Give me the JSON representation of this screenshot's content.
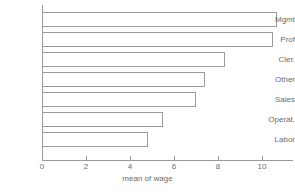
{
  "chart_data": {
    "type": "bar",
    "orientation": "horizontal",
    "title": "",
    "subtitle": "",
    "xlabel": "mean of wage",
    "ylabel": "",
    "categories": [
      "Mgmt",
      "Prof",
      "Cler.",
      "Other",
      "Sales",
      "Operat.",
      "Labor"
    ],
    "values": [
      10.7,
      10.5,
      8.3,
      7.4,
      7.0,
      5.5,
      4.8
    ],
    "series": [
      {
        "name": "mean of wage",
        "values": [
          10.7,
          10.5,
          8.3,
          7.4,
          7.0,
          5.5,
          4.8
        ]
      }
    ],
    "xlim": [
      0,
      11.4
    ],
    "xticks": [
      0,
      2,
      4,
      6,
      8,
      10
    ],
    "xtick_labels": [
      "0",
      "2",
      "4",
      "6",
      "8",
      "10"
    ],
    "grid": false,
    "legend": false,
    "legend_position": "none",
    "bar_fill_color": "#ffffff",
    "bar_edge_color": "#9a9a9a",
    "axis_color": "#9a9a9a",
    "text_color": "#6b6b6b",
    "background_color": "#ffffff"
  },
  "axis": {
    "x_title": "mean of wage",
    "ticks": [
      {
        "label": "0",
        "value": 0
      },
      {
        "label": "2",
        "value": 2
      },
      {
        "label": "4",
        "value": 4
      },
      {
        "label": "6",
        "value": 6
      },
      {
        "label": "8",
        "value": 8
      },
      {
        "label": "10",
        "value": 10
      }
    ]
  },
  "bars": [
    {
      "label": "Mgmt",
      "value": 10.7
    },
    {
      "label": "Prof",
      "value": 10.5
    },
    {
      "label": "Cler.",
      "value": 8.3
    },
    {
      "label": "Other",
      "value": 7.4
    },
    {
      "label": "Sales",
      "value": 7.0
    },
    {
      "label": "Operat.",
      "value": 5.5
    },
    {
      "label": "Labor",
      "value": 4.8
    }
  ]
}
